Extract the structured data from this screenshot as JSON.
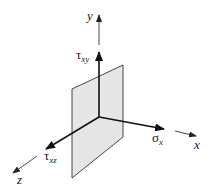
{
  "diagram": {
    "type": "stress-element-plane",
    "axes": {
      "x": {
        "label": "x"
      },
      "y": {
        "label": "y"
      },
      "z": {
        "label": "z"
      }
    },
    "stresses": {
      "normal": {
        "symbol": "σ",
        "subscript": "x"
      },
      "shear_xy": {
        "symbol": "τ",
        "subscript": "xy"
      },
      "shear_xz": {
        "symbol": "τ",
        "subscript": "xz"
      }
    },
    "colors": {
      "plane_fill": "#e6e6e6",
      "lines": "#222222"
    }
  }
}
